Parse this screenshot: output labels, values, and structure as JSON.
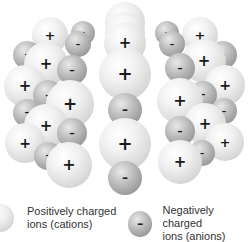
{
  "diagram": {
    "colors": {
      "cation": "#e6e6e6",
      "anion": "#a5a5a5",
      "sign": "#1a1a1a",
      "label": "#333333"
    },
    "ions": [
      {
        "type": "cation",
        "x": 125,
        "y": 22,
        "r": 20,
        "sign": "+"
      },
      {
        "type": "anion",
        "x": 83,
        "y": 33,
        "r": 12,
        "sign": "–"
      },
      {
        "type": "anion",
        "x": 167,
        "y": 33,
        "r": 12,
        "sign": "–"
      },
      {
        "type": "cation",
        "x": 50,
        "y": 35,
        "r": 18,
        "sign": "+"
      },
      {
        "type": "cation",
        "x": 200,
        "y": 35,
        "r": 18,
        "sign": "+"
      },
      {
        "type": "cation",
        "x": 125,
        "y": 32,
        "r": 20,
        "sign": "+"
      },
      {
        "type": "anion",
        "x": 78,
        "y": 44,
        "r": 13,
        "sign": "–"
      },
      {
        "type": "anion",
        "x": 172,
        "y": 44,
        "r": 13,
        "sign": "–"
      },
      {
        "type": "cation",
        "x": 125,
        "y": 43,
        "r": 21,
        "sign": "+"
      },
      {
        "type": "anion",
        "x": 27,
        "y": 55,
        "r": 14,
        "sign": "–"
      },
      {
        "type": "anion",
        "x": 223,
        "y": 55,
        "r": 14,
        "sign": "–"
      },
      {
        "type": "cation",
        "x": 46,
        "y": 64,
        "r": 22,
        "sign": "+"
      },
      {
        "type": "cation",
        "x": 204,
        "y": 61,
        "r": 22,
        "sign": "+"
      },
      {
        "type": "anion",
        "x": 72,
        "y": 70,
        "r": 15,
        "sign": "–"
      },
      {
        "type": "anion",
        "x": 180,
        "y": 68,
        "r": 15,
        "sign": "–"
      },
      {
        "type": "cation",
        "x": 125,
        "y": 74,
        "r": 26,
        "sign": "+"
      },
      {
        "type": "cation",
        "x": 25,
        "y": 86,
        "r": 21,
        "sign": "+"
      },
      {
        "type": "cation",
        "x": 225,
        "y": 85,
        "r": 20,
        "sign": "+"
      },
      {
        "type": "anion",
        "x": 48,
        "y": 95,
        "r": 15,
        "sign": "–"
      },
      {
        "type": "anion",
        "x": 203,
        "y": 95,
        "r": 14,
        "sign": "–"
      },
      {
        "type": "cation",
        "x": 70,
        "y": 104,
        "r": 24,
        "sign": "+"
      },
      {
        "type": "cation",
        "x": 180,
        "y": 101,
        "r": 23,
        "sign": "+"
      },
      {
        "type": "anion",
        "x": 125,
        "y": 110,
        "r": 17,
        "sign": "–"
      },
      {
        "type": "anion",
        "x": 27,
        "y": 113,
        "r": 14,
        "sign": "–"
      },
      {
        "type": "anion",
        "x": 224,
        "y": 111,
        "r": 13,
        "sign": "–"
      },
      {
        "type": "cation",
        "x": 46,
        "y": 126,
        "r": 22,
        "sign": "+"
      },
      {
        "type": "cation",
        "x": 205,
        "y": 124,
        "r": 21,
        "sign": "+"
      },
      {
        "type": "anion",
        "x": 72,
        "y": 133,
        "r": 15,
        "sign": "–"
      },
      {
        "type": "anion",
        "x": 180,
        "y": 131,
        "r": 15,
        "sign": "–"
      },
      {
        "type": "cation",
        "x": 25,
        "y": 143,
        "r": 20,
        "sign": "+"
      },
      {
        "type": "cation",
        "x": 225,
        "y": 142,
        "r": 19,
        "sign": "+"
      },
      {
        "type": "cation",
        "x": 125,
        "y": 144,
        "r": 26,
        "sign": "+"
      },
      {
        "type": "anion",
        "x": 48,
        "y": 156,
        "r": 14,
        "sign": "–"
      },
      {
        "type": "anion",
        "x": 202,
        "y": 153,
        "r": 13,
        "sign": "–"
      },
      {
        "type": "cation",
        "x": 69,
        "y": 165,
        "r": 23,
        "sign": "+"
      },
      {
        "type": "cation",
        "x": 180,
        "y": 162,
        "r": 22,
        "sign": "+"
      },
      {
        "type": "anion",
        "x": 125,
        "y": 178,
        "r": 17,
        "sign": "–"
      }
    ]
  },
  "legend": {
    "cation": {
      "label": "Positively charged\nions (cations)",
      "sign": "+"
    },
    "anion": {
      "label": "Negatively charged\nions (anions)",
      "sign": "–"
    }
  }
}
